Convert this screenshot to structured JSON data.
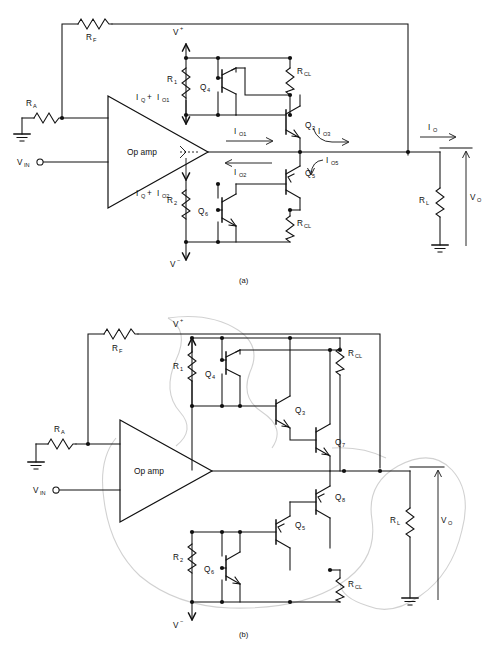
{
  "figure": {
    "panels": [
      {
        "id": "a",
        "caption": "(a)",
        "opamp_label": "Op amp",
        "labels": {
          "rf": "R",
          "rf_sub": "F",
          "ra": "R",
          "ra_sub": "A",
          "r1": "R",
          "r1_sub": "1",
          "r2": "R",
          "r2_sub": "2",
          "rcl_top": "R",
          "rcl_top_sub": "CL",
          "rcl_bot": "R",
          "rcl_bot_sub": "CL",
          "rl": "R",
          "rl_sub": "L",
          "vin": "V",
          "vin_sub": "IN",
          "vo": "V",
          "vo_sub": "O",
          "vplus": "V",
          "vplus_sup": "+",
          "vminus": "V",
          "vminus_sup": "−",
          "q4": "Q",
          "q4_sub": "4",
          "q3": "Q",
          "q3_sub": "3",
          "q5": "Q",
          "q5_sub": "5",
          "q6": "Q",
          "q6_sub": "6",
          "iq_io1": "I + I",
          "iq_io1_parts": {
            "a": "I",
            "a_sub": "Q",
            "plus": "+",
            "b": "I",
            "b_sub": "O1"
          },
          "iq_io2_parts": {
            "a": "I",
            "a_sub": "Q",
            "plus": "+",
            "b": "I",
            "b_sub": "O2"
          },
          "io1": "I",
          "io1_sub": "O1",
          "io2": "I",
          "io2_sub": "O2",
          "io3": "I",
          "io3_sub": "O3",
          "io5": "I",
          "io5_sub": "O5",
          "io": "I",
          "io_sub": "O"
        }
      },
      {
        "id": "b",
        "caption": "(b)",
        "opamp_label": "Op amp",
        "labels": {
          "rf": "R",
          "rf_sub": "F",
          "ra": "R",
          "ra_sub": "A",
          "r1": "R",
          "r1_sub": "1",
          "r2": "R",
          "r2_sub": "2",
          "rcl_top": "R",
          "rcl_top_sub": "CL",
          "rcl_bot": "R",
          "rcl_bot_sub": "CL",
          "rl": "R",
          "rl_sub": "L",
          "vin": "V",
          "vin_sub": "IN",
          "vo": "V",
          "vo_sub": "O",
          "vplus": "V",
          "vplus_sup": "+",
          "vminus": "V",
          "vminus_sup": "−",
          "q4": "Q",
          "q4_sub": "4",
          "q3": "Q",
          "q3_sub": "3",
          "q7": "Q",
          "q7_sub": "7",
          "q8": "Q",
          "q8_sub": "8",
          "q5": "Q",
          "q5_sub": "5",
          "q6": "Q",
          "q6_sub": "6"
        }
      }
    ]
  },
  "colors": {
    "ink": "#111111",
    "paper": "#ffffff",
    "pencil": "#c9c9c9"
  }
}
